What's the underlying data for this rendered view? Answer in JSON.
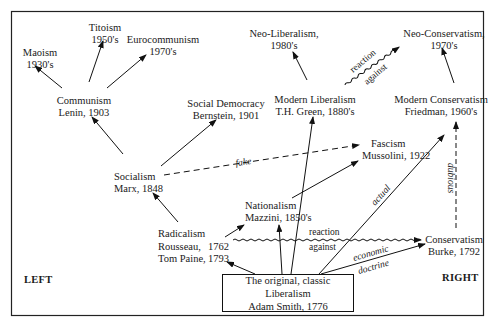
{
  "diagram": {
    "type": "ideological-genealogy",
    "sides": {
      "left": "LEFT",
      "right": "RIGHT"
    },
    "root": {
      "line1": "The original, classic Liberalism",
      "line2": "Adam Smith, 1776"
    },
    "nodes": {
      "maoism": {
        "line1": "Maoism",
        "line2": "1930's"
      },
      "titoism": {
        "line1": "Titoism",
        "line2": "1950's"
      },
      "eurocommunism": {
        "line1": "Eurocommunism",
        "line2": "1970's"
      },
      "communism": {
        "line1": "Communism",
        "line2": "Lenin, 1903"
      },
      "social_democracy": {
        "line1": "Social Democracy",
        "line2": "Bernstein, 1901"
      },
      "neo_liberalism": {
        "line1": "Neo-Liberalism,",
        "line2": "1980's"
      },
      "modern_liberalism": {
        "line1": "Modern Liberalism",
        "line2": "T.H. Green, 1880's"
      },
      "neo_conservatism": {
        "line1": "Neo-Conservatism,",
        "line2": "1970's"
      },
      "modern_conservatism": {
        "line1": "Modern Conservatism",
        "line2": "Friedman, 1960's"
      },
      "socialism": {
        "line1": "Socialism",
        "line2": "Marx, 1848"
      },
      "fascism": {
        "line1": "Fascism",
        "line2": "Mussolini, 1922"
      },
      "nationalism": {
        "line1": "Nationalism",
        "line2": "Mazzini, 1850's"
      },
      "radicalism": {
        "line1": "Radicalism",
        "line2a": "Rousseau,",
        "line2b": "1762",
        "line3a": "Tom Paine,",
        "line3b": "1793"
      },
      "conservatism": {
        "line1": "Conservatism",
        "line2": "Burke, 1792"
      }
    },
    "edge_labels": {
      "fake": "fake",
      "actual": "actual",
      "dubious": "dubious",
      "reaction_top": "reaction",
      "against_top": "against",
      "reaction_mid": "reaction",
      "against_mid": "against",
      "economic": "economic",
      "doctrine": "doctrine"
    },
    "edges": [
      {
        "from": "Adam Smith",
        "to": "Radicalism",
        "style": "solid"
      },
      {
        "from": "Adam Smith",
        "to": "Nationalism",
        "style": "solid"
      },
      {
        "from": "Adam Smith",
        "to": "Modern Liberalism",
        "style": "solid"
      },
      {
        "from": "Adam Smith",
        "to": "Modern Conservatism",
        "style": "solid",
        "label": "actual"
      },
      {
        "from": "Adam Smith",
        "to": "Conservatism",
        "style": "solid",
        "label": "economic doctrine"
      },
      {
        "from": "Radicalism",
        "to": "Socialism",
        "style": "solid"
      },
      {
        "from": "Radicalism",
        "to": "Nationalism",
        "style": "solid"
      },
      {
        "from": "Radicalism",
        "to": "Conservatism",
        "style": "wavy",
        "label": "reaction against"
      },
      {
        "from": "Socialism",
        "to": "Communism",
        "style": "solid"
      },
      {
        "from": "Socialism",
        "to": "Social Democracy",
        "style": "solid"
      },
      {
        "from": "Socialism",
        "to": "Fascism",
        "style": "dashed",
        "label": "fake"
      },
      {
        "from": "Nationalism",
        "to": "Fascism",
        "style": "solid"
      },
      {
        "from": "Communism",
        "to": "Maoism",
        "style": "solid"
      },
      {
        "from": "Communism",
        "to": "Titoism",
        "style": "solid"
      },
      {
        "from": "Communism",
        "to": "Eurocommunism",
        "style": "solid"
      },
      {
        "from": "Modern Liberalism",
        "to": "Neo-Liberalism",
        "style": "solid"
      },
      {
        "from": "Modern Liberalism",
        "to": "Neo-Conservatism",
        "style": "wavy",
        "label": "reaction against"
      },
      {
        "from": "Modern Conservatism",
        "to": "Neo-Conservatism",
        "style": "solid"
      },
      {
        "from": "Conservatism",
        "to": "Modern Conservatism",
        "style": "dashed",
        "label": "dubious"
      }
    ]
  }
}
